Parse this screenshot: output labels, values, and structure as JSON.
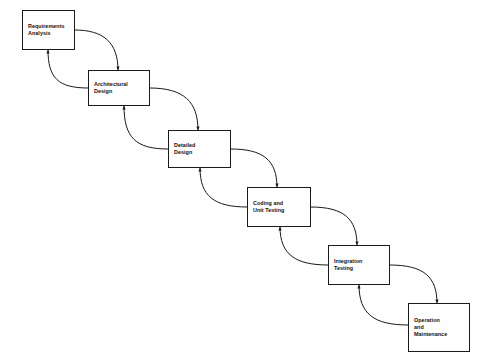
{
  "diagram": {
    "background_color": "#fefefe",
    "line_color": "#1a1a1a",
    "text_color": "#111111",
    "phases": [
      {
        "id": "requirements-analysis",
        "label": "Requirements\nAnalysis",
        "x": 22,
        "y": 10,
        "w": 53,
        "h": 40
      },
      {
        "id": "architectural-design",
        "label": "Architectural\nDesign",
        "x": 88,
        "y": 70,
        "w": 62,
        "h": 36
      },
      {
        "id": "detailed-design",
        "label": "Detailed\nDesign",
        "x": 168,
        "y": 130,
        "w": 63,
        "h": 38
      },
      {
        "id": "coding-and-unit-testing",
        "label": "Coding and\nUnit Testing",
        "x": 247,
        "y": 187,
        "w": 64,
        "h": 40
      },
      {
        "id": "integration-testing",
        "label": "Integration\nTesting",
        "x": 328,
        "y": 245,
        "w": 62,
        "h": 40
      },
      {
        "id": "operation-and-maintenance",
        "label": "Operation\nand\nMaintenance",
        "x": 408,
        "y": 303,
        "w": 62,
        "h": 49
      }
    ],
    "forward_connectors": [
      {
        "id": "forward-requirements-to-architectural",
        "path": "M 75 30 C 103 30 118 42 118 70"
      },
      {
        "id": "forward-architectural-to-detailed",
        "path": "M 150 88 C 184 88 198 102 198 130"
      },
      {
        "id": "forward-detailed-to-coding",
        "path": "M 231 149 C 263 149 277 160 277 187"
      },
      {
        "id": "forward-coding-to-integration",
        "path": "M 311 207 C 344 207 357 219 357 245"
      },
      {
        "id": "forward-integration-to-operation",
        "path": "M 390 265 C 424 265 437 277 437 303"
      }
    ],
    "feedback_connectors": [
      {
        "id": "feedback-architectural-to-requirements",
        "path": "M 88 88 C 58 88 48 78 48 50"
      },
      {
        "id": "feedback-detailed-to-architectural",
        "path": "M 168 149 C 136 149 124 138 124 106"
      },
      {
        "id": "feedback-coding-to-detailed",
        "path": "M 247 207 C 214 207 200 196 200 168"
      },
      {
        "id": "feedback-integration-to-coding",
        "path": "M 328 265 C 296 265 280 255 280 227"
      },
      {
        "id": "feedback-operation-to-integration",
        "path": "M 408 325 C 374 325 359 314 359 285"
      }
    ]
  }
}
